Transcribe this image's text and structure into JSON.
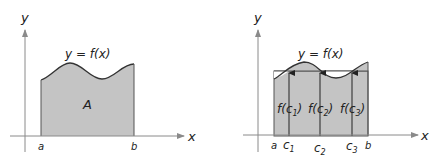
{
  "left_panel": {
    "y_axis_label": "y",
    "x_axis_label": "x",
    "curve_label": "y = f(x)",
    "area_label": "A",
    "a_label": "a",
    "b_label": "b"
  },
  "right_panel": {
    "y_axis_label": "y",
    "x_axis_label": "x",
    "curve_label": "y = f(x)",
    "a_label": "a",
    "b_label": "b",
    "sample_points": [
      {
        "label": "c",
        "sub": "1",
        "value_label_pre": "f(c",
        "value_label_post": ")"
      },
      {
        "label": "c",
        "sub": "2",
        "value_label_pre": "f(c",
        "value_label_post": ")"
      },
      {
        "label": "c",
        "sub": "3",
        "value_label_pre": "f(c",
        "value_label_post": ")"
      }
    ]
  },
  "colors": {
    "fill": "#c4c4c4",
    "axis": "#8a8a8a",
    "curve": "#333333",
    "text": "#222222"
  }
}
